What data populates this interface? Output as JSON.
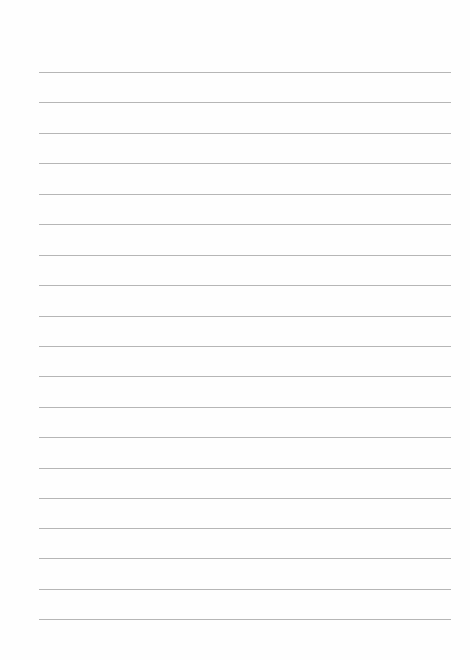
{
  "page": {
    "type": "blank-ruled-paper",
    "background": "#fefefe",
    "rule_color": "#a9a9a9",
    "rule_left": 39,
    "rule_right": 451,
    "rule_count": 19,
    "rule_positions_y": [
      72,
      102,
      133,
      163,
      194,
      224,
      255,
      285,
      316,
      346,
      376,
      407,
      437,
      468,
      498,
      528,
      558,
      589,
      619
    ]
  }
}
